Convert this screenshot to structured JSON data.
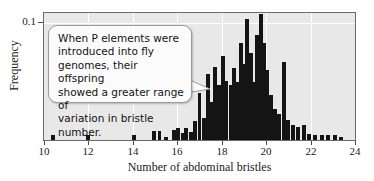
{
  "chart_data": {
    "type": "bar",
    "title": "",
    "subtitle": "",
    "xlabel": "Number of abdominal bristles",
    "ylabel": "Frequency",
    "xlim": [
      10,
      24
    ],
    "ylim": [
      0,
      0.109
    ],
    "xticks": [
      10,
      12,
      14,
      16,
      18,
      20,
      22,
      24
    ],
    "xtick_labels": [
      "10",
      "12",
      "14",
      "16",
      "18",
      "20",
      "22",
      "24"
    ],
    "yticks": [
      0.1
    ],
    "ytick_labels": [
      "0.1"
    ],
    "grid": "white gridlines at x major ticks and at y = 0.1",
    "legend": "none",
    "bin_width": 0.18,
    "bar_color": "#141414",
    "plot_background": "#e8e8e8",
    "annotations": [
      {
        "name": "callout",
        "text": "When P elements were introduced into fly genomes, their offspring showed a greater range of variation in bristle number.",
        "points_to_x": 18.4
      }
    ],
    "x": [
      10.4,
      12.0,
      14.05,
      14.95,
      15.2,
      15.5,
      15.85,
      16.05,
      16.25,
      16.4,
      16.6,
      16.8,
      17.0,
      17.2,
      17.4,
      17.55,
      17.7,
      17.9,
      18.05,
      18.2,
      18.4,
      18.55,
      18.7,
      18.85,
      19.0,
      19.15,
      19.3,
      19.45,
      19.6,
      19.75,
      19.9,
      20.05,
      20.2,
      20.4,
      20.6,
      20.8,
      21.0,
      21.2,
      21.45,
      21.7,
      21.95,
      22.2,
      22.5,
      22.8,
      23.1,
      23.35
    ],
    "values": [
      0.004,
      0.004,
      0.004,
      0.008,
      0.008,
      0.003,
      0.009,
      0.01,
      0.006,
      0.01,
      0.007,
      0.016,
      0.04,
      0.019,
      0.057,
      0.033,
      0.063,
      0.047,
      0.072,
      0.051,
      0.047,
      0.062,
      0.05,
      0.083,
      0.065,
      0.104,
      0.075,
      0.05,
      0.09,
      0.108,
      0.083,
      0.06,
      0.039,
      0.027,
      0.022,
      0.067,
      0.017,
      0.013,
      0.011,
      0.013,
      0.005,
      0.004,
      0.004,
      0.004,
      0.004,
      0.003
    ]
  },
  "callout": {
    "line1": "When P elements were",
    "line2": "introduced into fly",
    "line3": "genomes, their offspring",
    "line4": "showed a greater range of",
    "line5": "variation in bristle number."
  },
  "axes": {
    "x_title": "Number of abdominal bristles",
    "y_title": "Frequency",
    "y_tick": "0.1"
  }
}
